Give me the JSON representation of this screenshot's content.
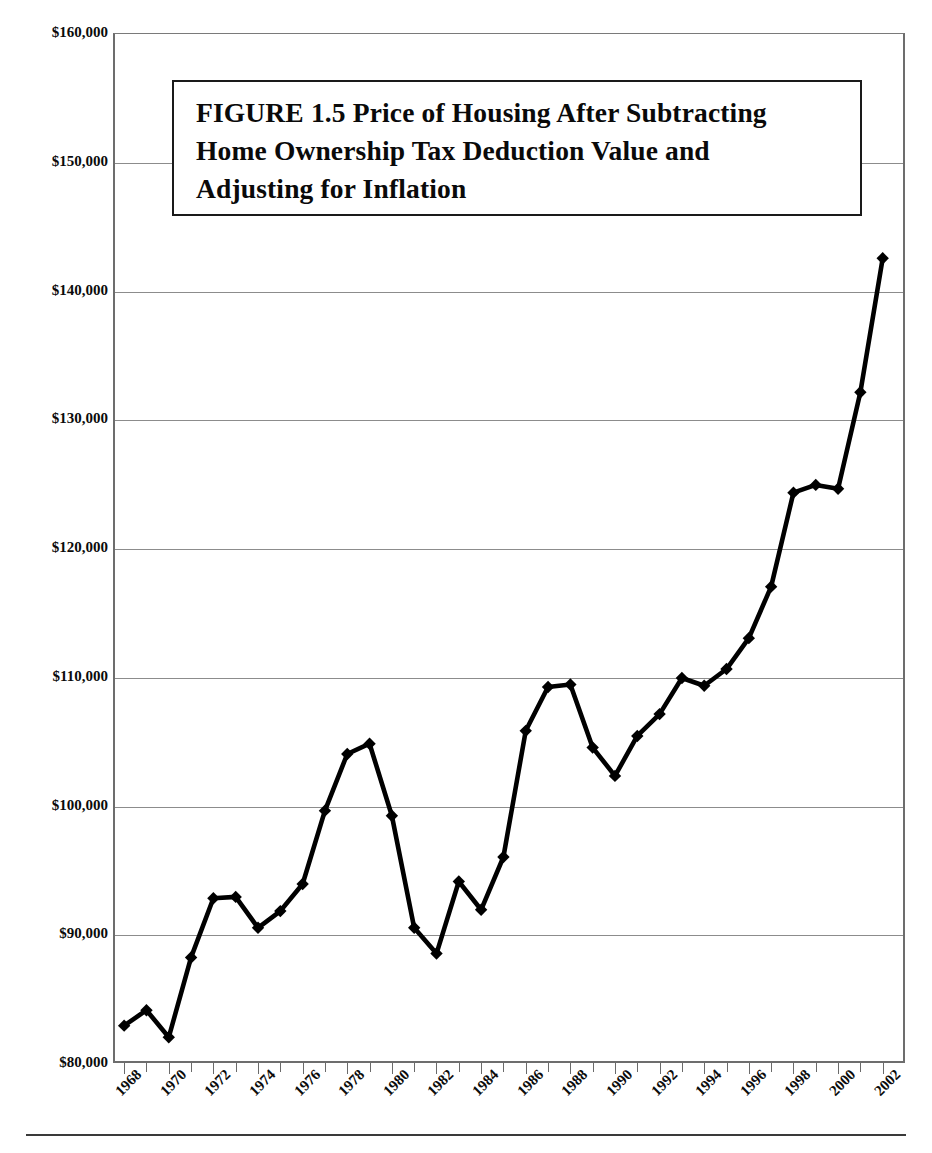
{
  "figure": {
    "title_lines": [
      "FIGURE 1.5  Price of Housing After Subtracting",
      "Home Ownership Tax Deduction Value and",
      "Adjusting for Inflation"
    ],
    "title_full": "FIGURE 1.5  Price of Housing After Subtracting Home Ownership Tax Deduction Value and Adjusting for Inflation"
  },
  "axes": {
    "y_title": "Housing Price Less Value of Tax Deduction (2002 Constant Dollars)",
    "y_tick_labels": [
      "$160,000",
      "$150,000",
      "$140,000",
      "$130,000",
      "$120,000",
      "$110,000",
      "$100,000",
      "$90,000",
      "$80,000"
    ],
    "x_tick_labels": [
      "1968",
      "1970",
      "1972",
      "1974",
      "1976",
      "1978",
      "1980",
      "1982",
      "1984",
      "1986",
      "1988",
      "1990",
      "1992",
      "1994",
      "1996",
      "1998",
      "2000",
      "2002"
    ]
  },
  "style": {
    "line_color": "#000000",
    "marker_color": "#000000",
    "grid_color": "#8c8c8c",
    "frame_color": "#6d6d6d",
    "background": "#ffffff"
  },
  "chart_data": {
    "type": "line",
    "xlabel": "",
    "ylabel": "Housing Price Less Value of Tax Deduction (2002 Constant Dollars)",
    "xlim": [
      1967.5,
      2003.0
    ],
    "ylim": [
      80000,
      160000
    ],
    "ytick_step": 10000,
    "xtick_step": 2,
    "grid": "horizontal",
    "legend": "none",
    "marker": "diamond",
    "x": [
      1968,
      1969,
      1970,
      1971,
      1972,
      1973,
      1974,
      1975,
      1976,
      1977,
      1978,
      1979,
      1980,
      1981,
      1982,
      1983,
      1984,
      1985,
      1986,
      1987,
      1988,
      1989,
      1990,
      1991,
      1992,
      1993,
      1994,
      1995,
      1996,
      1997,
      1998,
      1999,
      2000,
      2001,
      2002
    ],
    "series": [
      {
        "name": "Housing price less value of tax deduction",
        "values": [
          82900,
          84100,
          82000,
          88200,
          92800,
          92900,
          90500,
          91800,
          93900,
          99600,
          104000,
          104800,
          99200,
          90500,
          88500,
          94100,
          91900,
          96000,
          105800,
          109200,
          109400,
          104500,
          102300,
          105400,
          107100,
          109900,
          109300,
          110600,
          113000,
          117000,
          124300,
          124900,
          124600,
          132100,
          142500
        ]
      }
    ]
  }
}
